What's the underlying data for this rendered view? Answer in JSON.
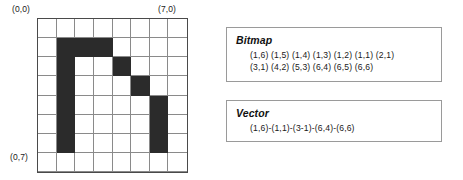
{
  "figure": {
    "corner_labels": {
      "top_left": "(0,0)",
      "top_right": "(7,0)",
      "bottom_left": "(0,7)"
    },
    "grid": {
      "columns": 8,
      "rows": 8,
      "fill_color": "#2b2b2b",
      "empty_color": "#ffffff",
      "gridline_color": "#8a8a8a",
      "border_color": "#4a4a4a",
      "filled_cells": [
        [
          1,
          1
        ],
        [
          2,
          1
        ],
        [
          3,
          1
        ],
        [
          1,
          2
        ],
        [
          4,
          2
        ],
        [
          1,
          3
        ],
        [
          5,
          3
        ],
        [
          1,
          4
        ],
        [
          6,
          4
        ],
        [
          1,
          5
        ],
        [
          6,
          5
        ],
        [
          1,
          6
        ],
        [
          6,
          6
        ]
      ]
    }
  },
  "bitmap_panel": {
    "title": "Bitmap",
    "lines": [
      "(1,6) (1,5) (1,4) (1,3) (1,2) (1,1) (2,1)",
      "(3,1) (4,2) (5,3) (6,4) (6,5) (6,6)"
    ]
  },
  "vector_panel": {
    "title": "Vector",
    "lines": [
      "(1,6)-(1,1)-(3-1)-(6,4)-(6,6)"
    ]
  },
  "chart_data": {
    "type": "heatmap",
    "title": "",
    "xlabel": "",
    "ylabel": "",
    "x": [
      0,
      1,
      2,
      3,
      4,
      5,
      6,
      7
    ],
    "y": [
      0,
      1,
      2,
      3,
      4,
      5,
      6,
      7
    ],
    "values": [
      [
        0,
        0,
        0,
        0,
        0,
        0,
        0,
        0
      ],
      [
        0,
        1,
        1,
        1,
        0,
        0,
        0,
        0
      ],
      [
        0,
        1,
        0,
        0,
        1,
        0,
        0,
        0
      ],
      [
        0,
        1,
        0,
        0,
        0,
        1,
        0,
        0
      ],
      [
        0,
        1,
        0,
        0,
        0,
        0,
        1,
        0
      ],
      [
        0,
        1,
        0,
        0,
        0,
        0,
        1,
        0
      ],
      [
        0,
        1,
        0,
        0,
        0,
        0,
        1,
        0
      ],
      [
        0,
        0,
        0,
        0,
        0,
        0,
        0,
        0
      ]
    ],
    "legend": [],
    "grid": true
  }
}
